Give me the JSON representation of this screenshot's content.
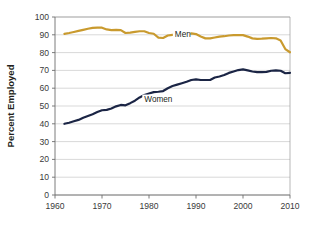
{
  "chart_data": {
    "type": "line",
    "title": "",
    "xlabel": "",
    "ylabel": "Percent Employed",
    "xlim": [
      1960,
      2010
    ],
    "ylim": [
      0,
      100
    ],
    "grid": true,
    "legend_position": "inline-annotations",
    "x_ticks": [
      "1960",
      "1970",
      "1980",
      "1990",
      "2000",
      "2010"
    ],
    "x_tick_values": [
      1960,
      1970,
      1980,
      1990,
      2000,
      2010
    ],
    "y_ticks": [
      "0",
      "10",
      "20",
      "30",
      "40",
      "50",
      "60",
      "70",
      "80",
      "90",
      "100"
    ],
    "y_tick_values": [
      0,
      10,
      20,
      30,
      40,
      50,
      60,
      70,
      80,
      90,
      100
    ],
    "annotations": [
      {
        "text": "Men",
        "x": 1985.5,
        "y": 89.0
      },
      {
        "text": "Women",
        "x": 1979.0,
        "y": 52.5
      }
    ],
    "series": [
      {
        "name": "Men",
        "color": "#c99a2e",
        "x": [
          1962,
          1963,
          1964,
          1965,
          1966,
          1967,
          1968,
          1969,
          1970,
          1971,
          1972,
          1973,
          1974,
          1975,
          1976,
          1977,
          1978,
          1979,
          1980,
          1981,
          1982,
          1983,
          1984,
          1985,
          1986,
          1987,
          1988,
          1989,
          1990,
          1991,
          1992,
          1993,
          1994,
          1995,
          1996,
          1997,
          1998,
          1999,
          2000,
          2001,
          2002,
          2003,
          2004,
          2005,
          2006,
          2007,
          2008,
          2009,
          2010
        ],
        "values": [
          90.5,
          91.0,
          91.6,
          92.2,
          92.8,
          93.4,
          93.9,
          94.0,
          94.0,
          93.0,
          92.6,
          92.8,
          92.6,
          91.0,
          91.2,
          91.6,
          92.0,
          92.0,
          91.0,
          90.6,
          88.4,
          88.2,
          89.6,
          90.0,
          90.1,
          90.4,
          90.6,
          90.8,
          90.4,
          89.0,
          88.0,
          88.0,
          88.5,
          89.0,
          89.2,
          89.6,
          89.8,
          89.8,
          89.8,
          89.0,
          88.0,
          87.7,
          87.8,
          88.0,
          88.2,
          88.0,
          86.8,
          82.0,
          80.2
        ]
      },
      {
        "name": "Women",
        "color": "#1b2545",
        "x": [
          1962,
          1963,
          1964,
          1965,
          1966,
          1967,
          1968,
          1969,
          1970,
          1971,
          1972,
          1973,
          1974,
          1975,
          1976,
          1977,
          1978,
          1979,
          1980,
          1981,
          1982,
          1983,
          1984,
          1985,
          1986,
          1987,
          1988,
          1989,
          1990,
          1991,
          1992,
          1993,
          1994,
          1995,
          1996,
          1997,
          1998,
          1999,
          2000,
          2001,
          2002,
          2003,
          2004,
          2005,
          2006,
          2007,
          2008,
          2009,
          2010
        ],
        "values": [
          40.0,
          40.6,
          41.4,
          42.2,
          43.4,
          44.4,
          45.4,
          46.6,
          47.6,
          47.8,
          48.6,
          49.8,
          50.6,
          50.4,
          51.6,
          53.0,
          54.8,
          56.2,
          57.0,
          57.8,
          58.0,
          58.4,
          60.0,
          61.2,
          62.0,
          62.8,
          63.6,
          64.6,
          65.0,
          64.6,
          64.6,
          64.6,
          66.0,
          66.6,
          67.4,
          68.6,
          69.4,
          70.2,
          70.6,
          70.0,
          69.4,
          69.0,
          69.0,
          69.2,
          69.8,
          70.0,
          69.8,
          68.4,
          68.6
        ]
      }
    ]
  }
}
